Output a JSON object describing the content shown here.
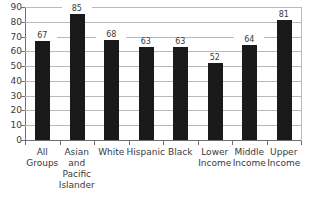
{
  "chart_data": {
    "type": "bar",
    "title": "",
    "xlabel": "",
    "ylabel": "",
    "ylim": [
      0,
      90
    ],
    "ytick_step": 10,
    "yticks": [
      90,
      80,
      70,
      60,
      50,
      40,
      30,
      20,
      10,
      0
    ],
    "grid": true,
    "legend": false,
    "categories": [
      "All\nGroups",
      "Asian\nand\nPacific\nIslander",
      "White",
      "Hispanic",
      "Black",
      "Lower\nIncome",
      "Middle\nIncome",
      "Upper\nIncome"
    ],
    "values": [
      67,
      85,
      68,
      63,
      63,
      52,
      64,
      81
    ],
    "bar_color": "#1a1a1a",
    "grid_color": "#b9b9b9",
    "axis_color": "#6f6f6f"
  }
}
